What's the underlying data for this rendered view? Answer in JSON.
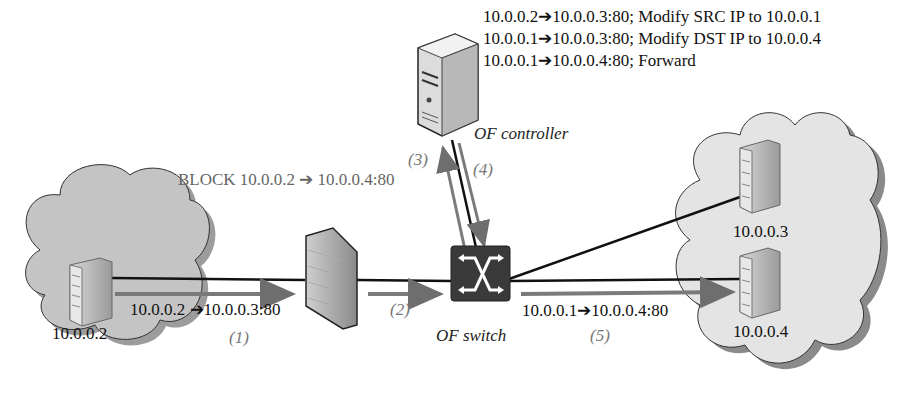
{
  "controller": {
    "label": "OF controller",
    "rules": [
      "10.0.0.2➔10.0.0.3:80; Modify SRC IP to 10.0.0.1",
      "10.0.0.1➔10.0.0.3:80; Modify DST IP to 10.0.0.4",
      "10.0.0.1➔10.0.0.4:80; Forward"
    ]
  },
  "firewall": {
    "rule": "BLOCK 10.0.0.2 ➔ 10.0.0.4:80"
  },
  "switch": {
    "label": "OF switch"
  },
  "hosts": {
    "client": "10.0.0.2",
    "server_a": "10.0.0.3",
    "server_b": "10.0.0.4"
  },
  "flows": {
    "f1": "10.0.0.2 ➔10.0.0.3:80",
    "f5": "10.0.0.1➔10.0.0.4:80"
  },
  "steps": [
    "(1)",
    "(2)",
    "(3)",
    "(4)",
    "(5)"
  ],
  "colors": {
    "cloud": "#c8c8c8",
    "cloud_light": "#e6e6e6",
    "switch": "#3a3a3a",
    "arrow_gray": "#7a7a7a"
  }
}
